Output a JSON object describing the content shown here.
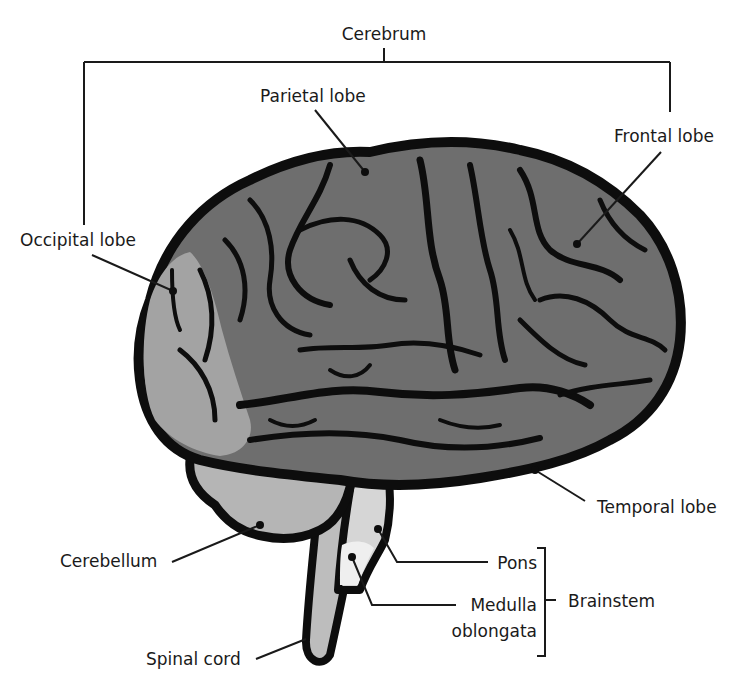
{
  "diagram": {
    "colors": {
      "background": "#ffffff",
      "outline": "#0d0d0d",
      "cerebrum_fill": "#6e6e6e",
      "occipital_fill": "#a3a3a3",
      "cerebellum_fill": "#b5b5b5",
      "pons_fill": "#d6d6d6",
      "medulla_fill": "#ececec",
      "spinal_cord_fill": "#bdbdbd",
      "leader_line": "#1a1a1a"
    },
    "groups": {
      "cerebrum": {
        "label": "Cerebrum"
      },
      "brainstem": {
        "label": "Brainstem"
      }
    },
    "labels": {
      "parietal_lobe": "Parietal lobe",
      "frontal_lobe": "Frontal lobe",
      "occipital_lobe": "Occipital lobe",
      "temporal_lobe": "Temporal lobe",
      "cerebellum": "Cerebellum",
      "pons": "Pons",
      "medulla_line1": "Medulla",
      "medulla_line2": "oblongata",
      "spinal_cord": "Spinal cord"
    }
  }
}
